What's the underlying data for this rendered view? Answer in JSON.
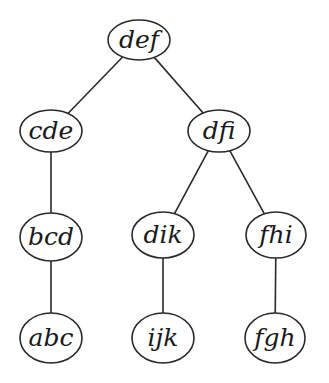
{
  "diagram": {
    "type": "tree",
    "stroke_color": "#2a2a2a",
    "text_color": "#1a1a1a",
    "background": "#ffffff",
    "nodes": [
      {
        "id": "def",
        "label": "def",
        "cx": 139,
        "cy": 40,
        "rx": 31,
        "ry": 20
      },
      {
        "id": "cde",
        "label": "cde",
        "cx": 51,
        "cy": 131,
        "rx": 31,
        "ry": 21
      },
      {
        "id": "dfi",
        "label": "dfi",
        "cx": 219,
        "cy": 131,
        "rx": 31,
        "ry": 21
      },
      {
        "id": "bcd",
        "label": "bcd",
        "cx": 51,
        "cy": 237,
        "rx": 31,
        "ry": 24
      },
      {
        "id": "dik",
        "label": "dik",
        "cx": 163,
        "cy": 235,
        "rx": 31,
        "ry": 23
      },
      {
        "id": "fhi",
        "label": "fhi",
        "cx": 276,
        "cy": 235,
        "rx": 30,
        "ry": 23
      },
      {
        "id": "abc",
        "label": "abc",
        "cx": 51,
        "cy": 338,
        "rx": 31,
        "ry": 25
      },
      {
        "id": "ijk",
        "label": "ijk",
        "cx": 163,
        "cy": 338,
        "rx": 31,
        "ry": 25
      },
      {
        "id": "fgh",
        "label": "fgh",
        "cx": 275,
        "cy": 338,
        "rx": 30,
        "ry": 25
      }
    ],
    "edges": [
      {
        "from": "def",
        "to": "cde"
      },
      {
        "from": "def",
        "to": "dfi"
      },
      {
        "from": "cde",
        "to": "bcd"
      },
      {
        "from": "dfi",
        "to": "dik"
      },
      {
        "from": "dfi",
        "to": "fhi"
      },
      {
        "from": "bcd",
        "to": "abc"
      },
      {
        "from": "dik",
        "to": "ijk"
      },
      {
        "from": "fhi",
        "to": "fgh"
      }
    ]
  }
}
